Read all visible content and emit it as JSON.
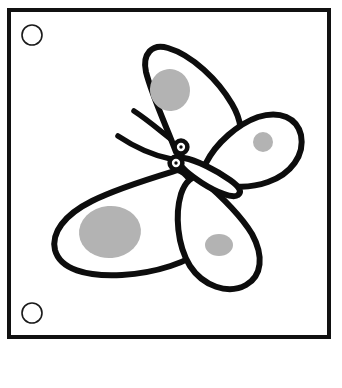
{
  "page": {
    "title": "Butterfly Coloring Page",
    "background_color": "#ffffff",
    "width": 342,
    "height": 388
  },
  "frame": {
    "name": "page-border",
    "stroke_color": "#111111",
    "stroke_width": 4,
    "x": 9,
    "y": 10,
    "width": 320,
    "height": 327
  },
  "binder_holes": [
    {
      "label": "top-hole",
      "cx": 32,
      "cy": 35,
      "r": 10
    },
    {
      "label": "bottom-hole",
      "cx": 32,
      "cy": 313,
      "r": 10
    }
  ],
  "hole": {
    "stroke_color": "#1a1a1a",
    "stroke_width": 1.6,
    "fill": "#ffffff"
  },
  "artwork": {
    "subject": "butterfly",
    "style": "black outline line art with gray wing spots",
    "outline_color": "#0d0d0d",
    "fill_color": "#ffffff",
    "spot_color": "#b3b3b3",
    "outline_width": 6
  },
  "wings": [
    {
      "name": "upper-left-wing",
      "path": "M176,152 C168,130 152,96 146,72 C142,54 152,43 168,48 C192,55 218,80 232,104 C242,121 243,136 236,146 C226,160 198,172 186,165 Z",
      "spot": {
        "cx": 170,
        "cy": 90,
        "rx": 20,
        "ry": 21,
        "rotate": -8
      }
    },
    {
      "name": "upper-right-wing",
      "path": "M206,163 C216,143 238,124 258,117 C280,110 297,118 301,135 C305,155 291,174 268,182 C246,190 220,187 208,178 C202,173 202,169 206,163 Z",
      "spot": {
        "cx": 263,
        "cy": 142,
        "rx": 10,
        "ry": 10,
        "rotate": 0
      }
    },
    {
      "name": "lower-left-wing",
      "path": "M178,170 C152,178 118,188 92,201 C64,215 51,233 55,250 C60,269 86,277 122,275 C156,273 190,262 204,248 C214,238 212,220 202,200 C194,184 186,172 178,170 Z",
      "spot": {
        "cx": 110,
        "cy": 232,
        "rx": 31,
        "ry": 26,
        "rotate": -5
      }
    },
    {
      "name": "lower-right-wing",
      "path": "M200,178 C214,190 240,214 252,234 C264,256 262,276 246,285 C228,295 203,286 190,266 C177,245 175,214 181,194 C185,182 193,174 200,178 Z",
      "spot": {
        "cx": 219,
        "cy": 245,
        "rx": 14,
        "ry": 11,
        "rotate": 0
      }
    }
  ],
  "body": {
    "name": "butterfly-body",
    "path": "M184,158 C196,160 216,170 230,180 C240,187 242,192 238,195 C233,199 216,192 202,183 C190,175 180,167 180,162 C180,159 181,157 184,158 Z"
  },
  "head_segments": [
    {
      "name": "head-upper",
      "cx": 181,
      "cy": 147,
      "r": 6.4,
      "pupil_r": 1.7
    },
    {
      "name": "head-lower",
      "cx": 176,
      "cy": 163,
      "r": 6.4,
      "pupil_r": 1.7
    }
  ],
  "antennae": [
    {
      "name": "antenna-upper",
      "path": "M176,143 C164,134 148,120 134,111"
    },
    {
      "name": "antenna-lower",
      "path": "M171,159 C156,156 136,148 118,136"
    }
  ]
}
